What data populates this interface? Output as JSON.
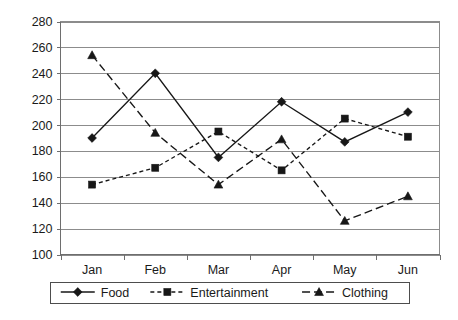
{
  "chart_data": {
    "type": "line",
    "title": "",
    "xlabel": "",
    "ylabel": "",
    "categories": [
      "Jan",
      "Feb",
      "Mar",
      "Apr",
      "May",
      "Jun"
    ],
    "ylim": [
      100,
      280
    ],
    "yticks": [
      100,
      120,
      140,
      160,
      180,
      200,
      220,
      240,
      260,
      280
    ],
    "grid": true,
    "legend_position": "bottom",
    "series": [
      {
        "name": "Food",
        "values": [
          190,
          240,
          175,
          218,
          187,
          210
        ],
        "line_style": "solid",
        "marker": "diamond",
        "color": "#171717"
      },
      {
        "name": "Entertainment",
        "values": [
          154,
          167,
          195,
          165,
          205,
          191
        ],
        "line_style": "dotted",
        "marker": "square",
        "color": "#171717"
      },
      {
        "name": "Clothing",
        "values": [
          254,
          194,
          154,
          189,
          126,
          145
        ],
        "line_style": "dashed",
        "marker": "triangle",
        "color": "#171717"
      }
    ]
  },
  "axis": {
    "y_tick_labels": [
      "280",
      "260",
      "240",
      "220",
      "200",
      "180",
      "160",
      "140",
      "120",
      "100"
    ],
    "x_tick_labels": [
      "Jan",
      "Feb",
      "Mar",
      "Apr",
      "May",
      "Jun"
    ]
  },
  "legend": {
    "entries": [
      {
        "label": "Food"
      },
      {
        "label": "Entertainment"
      },
      {
        "label": "Clothing"
      }
    ]
  }
}
